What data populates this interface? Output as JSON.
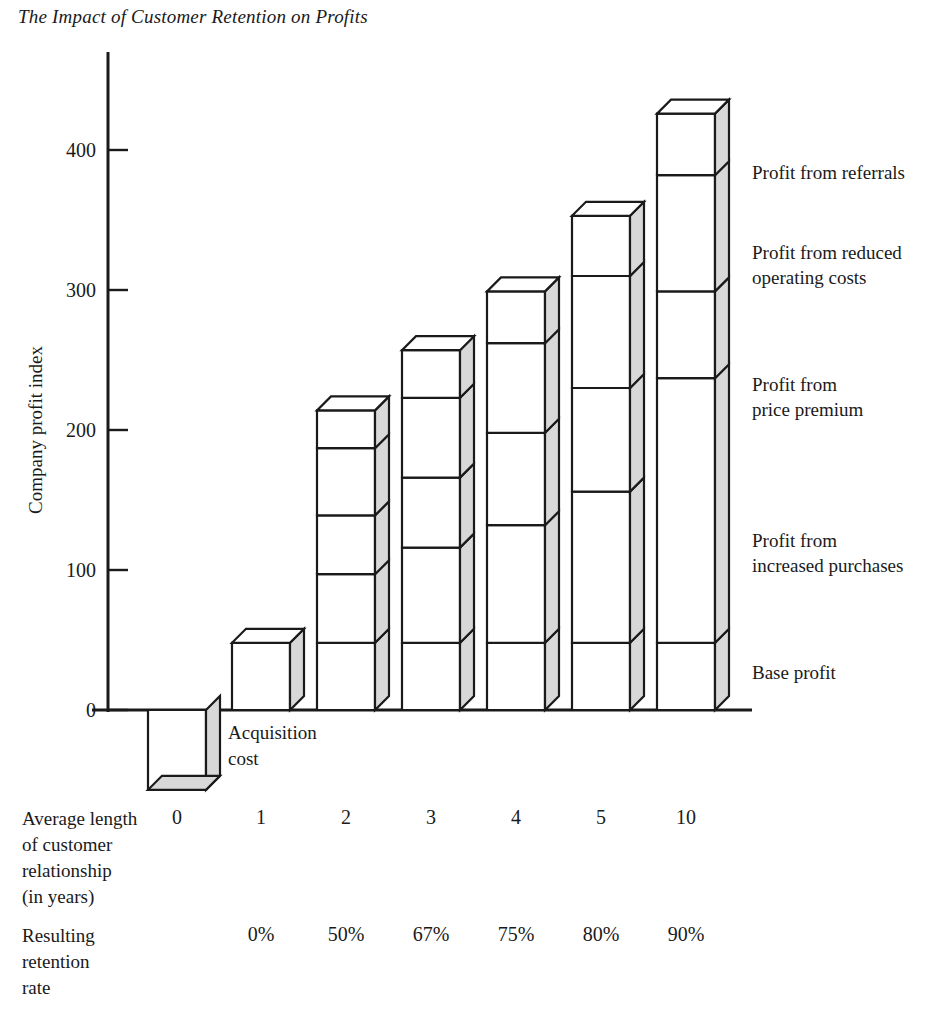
{
  "figure": {
    "title": "The Impact of Customer Retention on Profits"
  },
  "axes": {
    "y_title": "Company profit index",
    "y_ticks": [
      "0",
      "100",
      "200",
      "300",
      "400"
    ],
    "x_row1_title": "Average length\nof customer\nrelationship\n(in years)",
    "x_row2_title": "Resulting\nretention\nrate"
  },
  "segment_labels": [
    "Profit from referrals",
    "Profit from reduced\noperating costs",
    "Profit from\nprice premium",
    "Profit from\nincreased purchases",
    "Base profit"
  ],
  "annotations": {
    "acquisition_cost": "Acquisition\ncost"
  },
  "colors": {
    "ink": "#1a1a1a",
    "bar_face": "#ffffff",
    "bar_side": "#d8d8d8",
    "background": "#ffffff"
  },
  "chart_data": {
    "type": "bar",
    "subtype": "stacked-3d-column",
    "title": "The Impact of Customer Retention on Profits",
    "xlabel": "Average length of customer relationship (in years)",
    "ylabel": "Company profit index",
    "ylim": [
      -60,
      440
    ],
    "ytick_values": [
      0,
      100,
      200,
      300,
      400
    ],
    "grid": false,
    "legend_position": "right-inline",
    "categories": [
      "0",
      "1",
      "2",
      "3",
      "4",
      "5",
      "10"
    ],
    "retention_rates": [
      "",
      "0%",
      "50%",
      "67%",
      "75%",
      "80%",
      "90%"
    ],
    "series": [
      {
        "name": "Base profit",
        "values": [
          0,
          48,
          48,
          48,
          48,
          48,
          48
        ]
      },
      {
        "name": "Profit from increased purchases",
        "values": [
          0,
          0,
          49,
          68,
          84,
          108,
          189
        ]
      },
      {
        "name": "Profit from price premium",
        "values": [
          0,
          0,
          42,
          50,
          66,
          74,
          62
        ]
      },
      {
        "name": "Profit from reduced operating costs",
        "values": [
          0,
          0,
          48,
          57,
          64,
          80,
          83
        ]
      },
      {
        "name": "Profit from referrals",
        "values": [
          0,
          0,
          27,
          34,
          37,
          43,
          44
        ]
      },
      {
        "name": "Acquisition cost",
        "values": [
          -57,
          0,
          0,
          0,
          0,
          0,
          0
        ]
      }
    ],
    "cumulative_totals": [
      -57,
      48,
      214,
      257,
      299,
      353,
      426
    ],
    "segment_boundaries": {
      "0": [
        0,
        -57
      ],
      "1": [
        0,
        48
      ],
      "2": [
        0,
        48,
        97,
        139,
        187,
        214
      ],
      "3": [
        0,
        48,
        116,
        166,
        223,
        257
      ],
      "4": [
        0,
        48,
        132,
        198,
        262,
        299
      ],
      "5": [
        0,
        48,
        156,
        230,
        310,
        353
      ],
      "10": [
        0,
        48,
        237,
        299,
        382,
        426
      ]
    }
  }
}
